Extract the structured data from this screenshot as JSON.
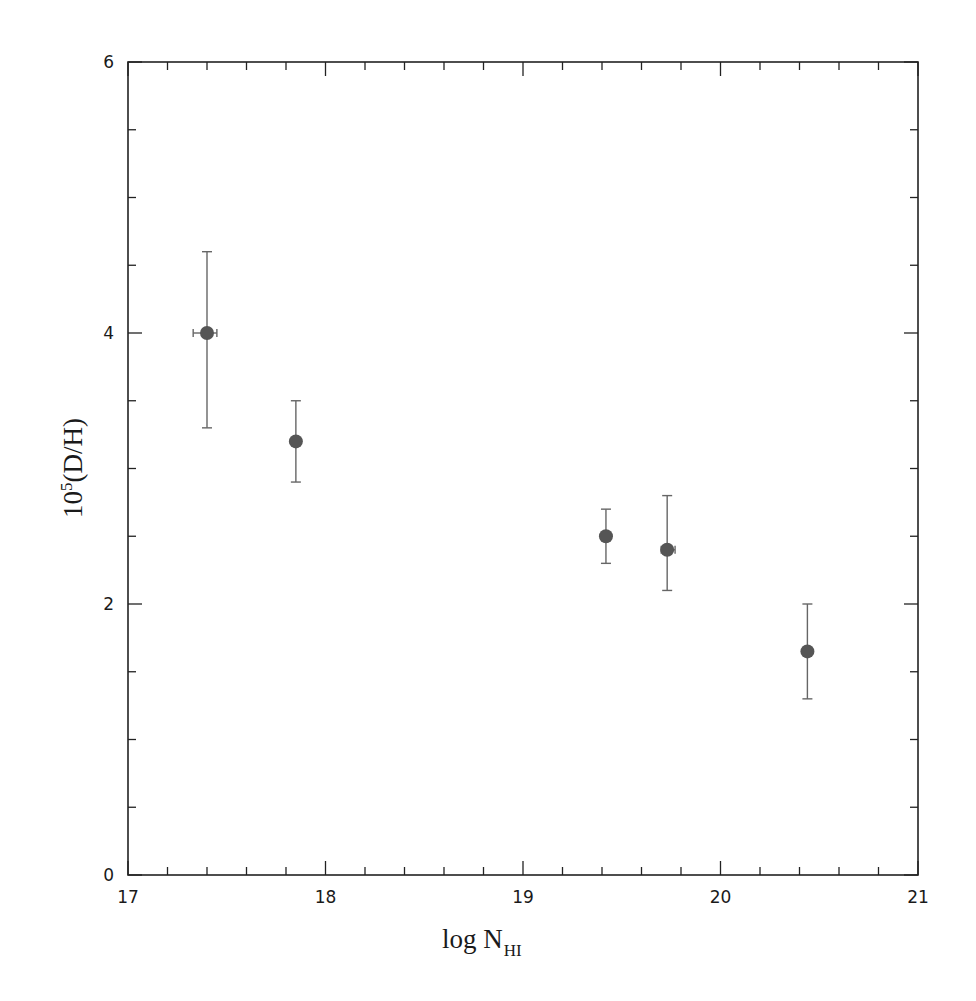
{
  "chart_data": {
    "type": "scatter",
    "title": "",
    "xlabel": "log N_HI",
    "xlabel_main": "log N",
    "xlabel_sub": "HI",
    "ylabel": "10^5(D/H)",
    "ylabel_base": "10",
    "ylabel_exp": "5",
    "ylabel_rest": "(D/H)",
    "xlim": [
      17,
      21
    ],
    "ylim": [
      0,
      6
    ],
    "x_ticks": [
      17,
      18,
      19,
      20,
      21
    ],
    "x_tick_labels": [
      "17",
      "18",
      "19",
      "20",
      "21"
    ],
    "x_minor_step": 0.2,
    "y_ticks": [
      0,
      2,
      4,
      6
    ],
    "y_tick_labels": [
      "0",
      "2",
      "4",
      "6"
    ],
    "y_minor_step": 0.5,
    "grid": false,
    "legend": null,
    "marker_color": "#555555",
    "errorbar_color": "#666666",
    "axis_color": "#222222",
    "points": [
      {
        "x": 17.4,
        "y": 4.0,
        "y_low": 3.3,
        "y_high": 4.6,
        "x_low": 17.33,
        "x_high": 17.45
      },
      {
        "x": 17.85,
        "y": 3.2,
        "y_low": 2.9,
        "y_high": 3.5
      },
      {
        "x": 19.42,
        "y": 2.5,
        "y_low": 2.3,
        "y_high": 2.7
      },
      {
        "x": 19.73,
        "y": 2.4,
        "y_low": 2.1,
        "y_high": 2.8,
        "x_low": 19.7,
        "x_high": 19.77
      },
      {
        "x": 20.44,
        "y": 1.65,
        "y_low": 1.3,
        "y_high": 2.0
      }
    ]
  }
}
